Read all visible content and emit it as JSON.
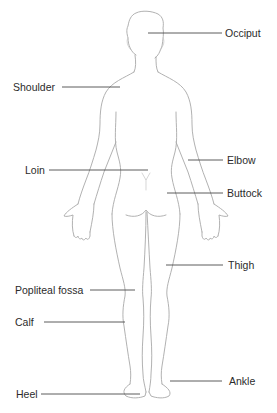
{
  "diagram": {
    "view": "back",
    "colors": {
      "figure_outline": "#a8a8a8",
      "leader_line": "#4a4a4a",
      "label_text": "#2b2b2b",
      "background": "#ffffff"
    },
    "labels": [
      {
        "id": "occiput",
        "text": "Occiput",
        "side": "right",
        "x": 225,
        "y": 33,
        "line": {
          "x1": 148,
          "x2": 222,
          "y": 33
        }
      },
      {
        "id": "shoulder",
        "text": "Shoulder",
        "side": "left",
        "x": 13,
        "y": 87,
        "line": {
          "x1": 62,
          "x2": 120,
          "y": 87
        }
      },
      {
        "id": "elbow",
        "text": "Elbow",
        "side": "right",
        "x": 227,
        "y": 160,
        "line": {
          "x1": 188,
          "x2": 223,
          "y": 160
        }
      },
      {
        "id": "loin",
        "text": "Loin",
        "side": "left",
        "x": 25,
        "y": 170,
        "line": {
          "x1": 49,
          "x2": 148,
          "y": 170
        }
      },
      {
        "id": "buttock",
        "text": "Buttock",
        "side": "right",
        "x": 227,
        "y": 193,
        "line": {
          "x1": 167,
          "x2": 223,
          "y": 193
        }
      },
      {
        "id": "thigh",
        "text": "Thigh",
        "side": "right",
        "x": 228,
        "y": 265,
        "line": {
          "x1": 166,
          "x2": 223,
          "y": 265
        }
      },
      {
        "id": "popliteal-fossa",
        "text": "Popliteal fossa",
        "side": "left",
        "x": 15,
        "y": 290,
        "line": {
          "x1": 90,
          "x2": 135,
          "y": 290
        }
      },
      {
        "id": "calf",
        "text": "Calf",
        "side": "left",
        "x": 15,
        "y": 322,
        "line": {
          "x1": 44,
          "x2": 125,
          "y": 322
        }
      },
      {
        "id": "ankle",
        "text": "Ankle",
        "side": "right",
        "x": 229,
        "y": 381,
        "line": {
          "x1": 170,
          "x2": 222,
          "y": 381
        }
      },
      {
        "id": "heel",
        "text": "Heel",
        "side": "left",
        "x": 16,
        "y": 394,
        "line": {
          "x1": 41,
          "x2": 140,
          "y": 394
        }
      }
    ]
  }
}
